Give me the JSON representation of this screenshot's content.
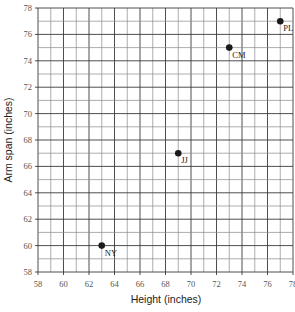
{
  "chart_data": {
    "type": "scatter",
    "title": "",
    "xlabel": "Height (inches)",
    "ylabel": "Arm span (inches)",
    "xlim": [
      58,
      78
    ],
    "ylim": [
      58,
      78
    ],
    "x_ticks": [
      58,
      60,
      62,
      64,
      66,
      68,
      70,
      72,
      74,
      76,
      78
    ],
    "y_ticks": [
      58,
      60,
      62,
      64,
      66,
      68,
      70,
      72,
      74,
      76,
      78
    ],
    "grid": true,
    "minor_grid_step": 1,
    "legend": "none",
    "points": [
      {
        "label": "NY",
        "x": 63,
        "y": 60
      },
      {
        "label": "JJ",
        "x": 69,
        "y": 67
      },
      {
        "label": "CM",
        "x": 73,
        "y": 75
      },
      {
        "label": "PL",
        "x": 77,
        "y": 77
      }
    ],
    "colors": {
      "point": "#1a1a1a",
      "major_grid": "#3a3a3a",
      "minor_grid": "#8a8a8a"
    }
  }
}
